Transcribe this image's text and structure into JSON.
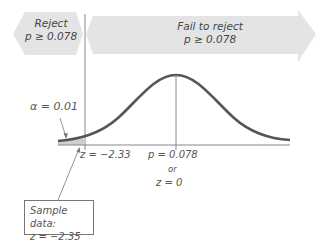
{
  "regions": {
    "reject": {
      "label": "Reject",
      "condition": "p ≥ 0.078"
    },
    "fail_to_reject": {
      "label": "Fail to reject",
      "condition": "p ≥ 0.078"
    }
  },
  "alpha_label": "α = 0.01",
  "critical_value_label": "z = −2.33",
  "center_label": {
    "p": "p = 0.078",
    "or": "or",
    "z": "z = 0"
  },
  "sample_box": {
    "title": "Sample data:",
    "value": "z = −2.35"
  },
  "colors": {
    "arrow_fill": "#e4e4e4",
    "curve": "#555555",
    "tail_fill": "#cfcfcf",
    "axis": "#888888"
  }
}
